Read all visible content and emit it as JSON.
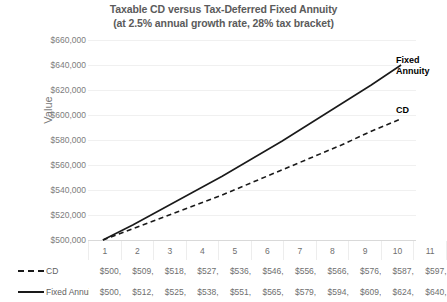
{
  "chart_data": {
    "type": "line",
    "title": "Taxable CD versus Tax-Deferred Fixed Annuity (at 2.5% annual growth rate, 28% tax bracket)",
    "title_lines": [
      "Taxable CD versus Tax-Deferred Fixed Annuity",
      "(at 2.5% annual growth rate, 28% tax bracket)"
    ],
    "xlabel": "",
    "ylabel": "Value",
    "ylim": [
      500000,
      660000
    ],
    "ytick_step": 20000,
    "grid": true,
    "legend_position": "table-left",
    "categories": [
      "1",
      "2",
      "3",
      "4",
      "5",
      "6",
      "7",
      "8",
      "9",
      "10",
      "11"
    ],
    "ytick_labels": [
      "$660,000",
      "$640,000",
      "$620,000",
      "$600,000",
      "$580,000",
      "$560,000",
      "$540,000",
      "$520,000",
      "$500,000"
    ],
    "ytick_values": [
      660000,
      640000,
      620000,
      600000,
      580000,
      560000,
      540000,
      520000,
      500000
    ],
    "series": [
      {
        "name": "CD",
        "style": "dashed",
        "color": "#1a1a1a",
        "values": [
          500000,
          509000,
          518000,
          527000,
          536000,
          546000,
          556000,
          566000,
          576000,
          587000,
          597000
        ],
        "display_values": [
          "$500,",
          "$509,",
          "$518,",
          "$527,",
          "$536,",
          "$546,",
          "$556,",
          "$566,",
          "$576,",
          "$587,",
          "$597,"
        ],
        "inline_label": "CD"
      },
      {
        "name": "Fixed Annuity",
        "style": "solid",
        "color": "#1a1a1a",
        "values": [
          500000,
          512000,
          525000,
          538000,
          551000,
          565000,
          579000,
          594000,
          609000,
          624000,
          640000
        ],
        "display_values": [
          "$500,",
          "$512,",
          "$525,",
          "$538,",
          "$551,",
          "$565,",
          "$579,",
          "$594,",
          "$609,",
          "$624,",
          "$640,"
        ],
        "inline_label_lines": [
          "Fixed",
          "Annuity"
        ]
      }
    ],
    "annotations": {
      "fixed_annuity_label_line1": "Fixed",
      "fixed_annuity_label_line2": "Annuity",
      "cd_label": "CD"
    },
    "colors": {
      "title": "#5b5b5b",
      "axis_text": "#7d7d7d",
      "gridline": "#f0f0f0",
      "series_line": "#1a1a1a",
      "table_border": "#ededed"
    }
  }
}
